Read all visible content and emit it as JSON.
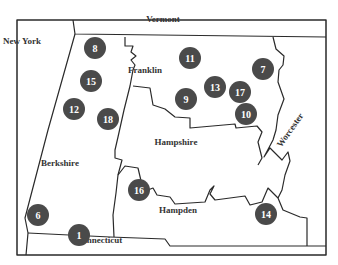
{
  "map": {
    "regions": [
      {
        "name": "New York",
        "x": 22,
        "y": 41
      },
      {
        "name": "Vermont",
        "x": 163,
        "y": 19
      },
      {
        "name": "Franklin",
        "x": 145,
        "y": 70
      },
      {
        "name": "Hampshire",
        "x": 176,
        "y": 142
      },
      {
        "name": "Berkshire",
        "x": 60,
        "y": 163
      },
      {
        "name": "Hampden",
        "x": 178,
        "y": 210
      },
      {
        "name": "Connecticut",
        "x": 99,
        "y": 240
      },
      {
        "name": "Worcester",
        "x": 290,
        "y": 130,
        "rotate": -55
      }
    ],
    "markers": [
      {
        "label": "8",
        "x": 95,
        "y": 48
      },
      {
        "label": "15",
        "x": 91,
        "y": 81
      },
      {
        "label": "12",
        "x": 74,
        "y": 109
      },
      {
        "label": "18",
        "x": 108,
        "y": 119
      },
      {
        "label": "11",
        "x": 190,
        "y": 58
      },
      {
        "label": "7",
        "x": 263,
        "y": 69
      },
      {
        "label": "13",
        "x": 215,
        "y": 87
      },
      {
        "label": "17",
        "x": 240,
        "y": 92
      },
      {
        "label": "9",
        "x": 186,
        "y": 99
      },
      {
        "label": "10",
        "x": 246,
        "y": 114
      },
      {
        "label": "16",
        "x": 139,
        "y": 190
      },
      {
        "label": "14",
        "x": 266,
        "y": 214
      },
      {
        "label": "6",
        "x": 38,
        "y": 215
      },
      {
        "label": "1",
        "x": 79,
        "y": 235
      }
    ],
    "colors": {
      "marker": "#4a4a4a",
      "border": "#2a2a2a"
    }
  }
}
